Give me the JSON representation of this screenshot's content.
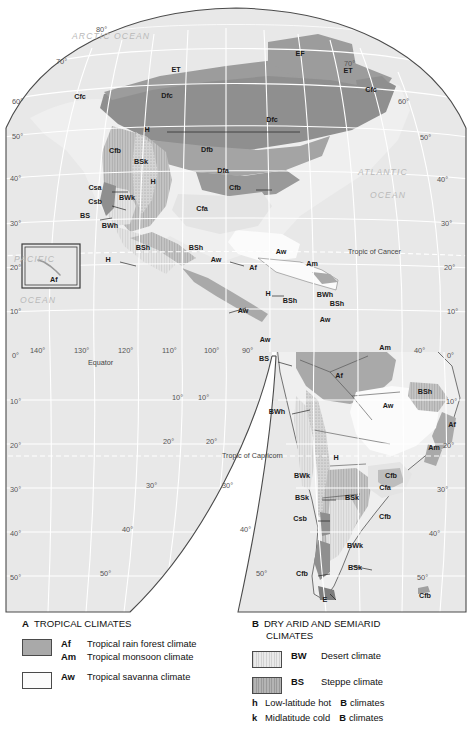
{
  "map": {
    "title": "Climate map of North and South America (Köppen classification)",
    "oceans": [
      {
        "name": "ARCTIC OCEAN",
        "x": 126,
        "y": 36
      },
      {
        "name": "ATLANTIC",
        "x": 388,
        "y": 172
      },
      {
        "name": "OCEAN",
        "x": 398,
        "y": 196
      },
      {
        "name": "PACIFIC",
        "x": 38,
        "y": 258
      },
      {
        "name": "OCEAN",
        "x": 44,
        "y": 300
      }
    ],
    "special_lines": [
      {
        "name": "Tropic of Cancer",
        "x": 370,
        "y": 257
      },
      {
        "name": "Equator",
        "x": 108,
        "y": 363
      },
      {
        "name": "Tropic of Capricorn",
        "x": 262,
        "y": 456
      }
    ],
    "lat_labels_left": [
      {
        "text": "60°",
        "x": 10,
        "y": 100
      },
      {
        "text": "50°",
        "x": 10,
        "y": 135
      },
      {
        "text": "40°",
        "x": 10,
        "y": 172
      },
      {
        "text": "30°",
        "x": 10,
        "y": 211
      },
      {
        "text": "20°",
        "x": 10,
        "y": 256
      },
      {
        "text": "10°",
        "x": 10,
        "y": 310
      },
      {
        "text": "0°",
        "x": 10,
        "y": 361
      },
      {
        "text": "10°",
        "x": 10,
        "y": 410
      },
      {
        "text": "20°",
        "x": 10,
        "y": 455
      },
      {
        "text": "30°",
        "x": 10,
        "y": 496
      },
      {
        "text": "40°",
        "x": 10,
        "y": 533
      },
      {
        "text": "50°",
        "x": 10,
        "y": 572
      }
    ],
    "lat_labels_right": [
      {
        "text": "60°",
        "x": 405,
        "y": 102
      },
      {
        "text": "50°",
        "x": 422,
        "y": 136
      },
      {
        "text": "40°",
        "x": 437,
        "y": 179
      },
      {
        "text": "30°",
        "x": 440,
        "y": 224
      },
      {
        "text": "20°",
        "x": 443,
        "y": 268
      },
      {
        "text": "10°",
        "x": 447,
        "y": 312
      },
      {
        "text": "0°",
        "x": 449,
        "y": 356
      },
      {
        "text": "10°",
        "x": 447,
        "y": 400
      },
      {
        "text": "20°",
        "x": 444,
        "y": 447
      },
      {
        "text": "30°",
        "x": 438,
        "y": 494
      },
      {
        "text": "40°",
        "x": 430,
        "y": 538
      },
      {
        "text": "50°",
        "x": 418,
        "y": 578
      }
    ],
    "lat_labels_interior": [
      {
        "text": "80°",
        "x": 107,
        "y": 30
      },
      {
        "text": "70°",
        "x": 63,
        "y": 62
      },
      {
        "text": "70°",
        "x": 352,
        "y": 63
      },
      {
        "text": "60°",
        "x": 22,
        "y": 102
      },
      {
        "text": "50°",
        "x": 20,
        "y": 137
      },
      {
        "text": "10°",
        "x": 178,
        "y": 396
      },
      {
        "text": "20°",
        "x": 170,
        "y": 440
      },
      {
        "text": "30°",
        "x": 152,
        "y": 484
      },
      {
        "text": "40°",
        "x": 128,
        "y": 528
      },
      {
        "text": "50°",
        "x": 108,
        "y": 572
      },
      {
        "text": "10°",
        "x": 205,
        "y": 396
      },
      {
        "text": "20°",
        "x": 213,
        "y": 440
      },
      {
        "text": "30°",
        "x": 228,
        "y": 484
      },
      {
        "text": "40°",
        "x": 246,
        "y": 528
      },
      {
        "text": "50°",
        "x": 261,
        "y": 572
      }
    ],
    "lon_labels": [
      {
        "text": "140°",
        "x": 33,
        "y": 353
      },
      {
        "text": "130°",
        "x": 78,
        "y": 353
      },
      {
        "text": "120°",
        "x": 122,
        "y": 353
      },
      {
        "text": "110°",
        "x": 165,
        "y": 353
      },
      {
        "text": "100°",
        "x": 207,
        "y": 353
      },
      {
        "text": "90°",
        "x": 243,
        "y": 353
      },
      {
        "text": "40°",
        "x": 418,
        "y": 353
      }
    ],
    "inset": {
      "label": "Af",
      "x": 22,
      "y": 244,
      "w": 58,
      "h": 44
    },
    "climate_labels": [
      {
        "code": "ET",
        "x": 176,
        "y": 72
      },
      {
        "code": "EF",
        "x": 300,
        "y": 56
      },
      {
        "code": "ET",
        "x": 348,
        "y": 73
      },
      {
        "code": "Cfc",
        "x": 371,
        "y": 92
      },
      {
        "code": "Cfc",
        "x": 80,
        "y": 99
      },
      {
        "code": "Dfc",
        "x": 167,
        "y": 98
      },
      {
        "code": "Dfc",
        "x": 272,
        "y": 122
      },
      {
        "code": "H",
        "x": 147,
        "y": 132
      },
      {
        "code": "Cfb",
        "x": 115,
        "y": 153
      },
      {
        "code": "Dfb",
        "x": 207,
        "y": 152
      },
      {
        "code": "BSk",
        "x": 141,
        "y": 164
      },
      {
        "code": "Dfa",
        "x": 223,
        "y": 173
      },
      {
        "code": "H",
        "x": 153,
        "y": 184
      },
      {
        "code": "Csa",
        "x": 95,
        "y": 190
      },
      {
        "code": "Cfb",
        "x": 235,
        "y": 190
      },
      {
        "code": "Csb",
        "x": 95,
        "y": 204
      },
      {
        "code": "BWk",
        "x": 127,
        "y": 200
      },
      {
        "code": "Cfa",
        "x": 202,
        "y": 211
      },
      {
        "code": "BS",
        "x": 85,
        "y": 218
      },
      {
        "code": "BWh",
        "x": 110,
        "y": 228
      },
      {
        "code": "BSh",
        "x": 143,
        "y": 250
      },
      {
        "code": "BSh",
        "x": 196,
        "y": 250
      },
      {
        "code": "Aw",
        "x": 281,
        "y": 254
      },
      {
        "code": "H",
        "x": 108,
        "y": 262
      },
      {
        "code": "Aw",
        "x": 216,
        "y": 262
      },
      {
        "code": "Af",
        "x": 253,
        "y": 270
      },
      {
        "code": "Am",
        "x": 312,
        "y": 266
      },
      {
        "code": "H",
        "x": 268,
        "y": 296
      },
      {
        "code": "BSh",
        "x": 290,
        "y": 303
      },
      {
        "code": "BWh",
        "x": 325,
        "y": 297
      },
      {
        "code": "BSh",
        "x": 337,
        "y": 306
      },
      {
        "code": "Aw",
        "x": 243,
        "y": 313
      },
      {
        "code": "Aw",
        "x": 325,
        "y": 322
      },
      {
        "code": "Aw",
        "x": 265,
        "y": 342
      },
      {
        "code": "Am",
        "x": 385,
        "y": 350
      },
      {
        "code": "BS",
        "x": 264,
        "y": 361
      },
      {
        "code": "Af",
        "x": 339,
        "y": 378
      },
      {
        "code": "BSh",
        "x": 425,
        "y": 394
      },
      {
        "code": "Aw",
        "x": 388,
        "y": 408
      },
      {
        "code": "BWh",
        "x": 277,
        "y": 414
      },
      {
        "code": "Af",
        "x": 452,
        "y": 427
      },
      {
        "code": "Am",
        "x": 434,
        "y": 450
      },
      {
        "code": "H",
        "x": 336,
        "y": 460
      },
      {
        "code": "BWk",
        "x": 302,
        "y": 478
      },
      {
        "code": "Cfb",
        "x": 391,
        "y": 478
      },
      {
        "code": "BSk",
        "x": 302,
        "y": 500
      },
      {
        "code": "BSk",
        "x": 352,
        "y": 500
      },
      {
        "code": "Cfa",
        "x": 385,
        "y": 490
      },
      {
        "code": "Csb",
        "x": 300,
        "y": 521
      },
      {
        "code": "Cfb",
        "x": 385,
        "y": 519
      },
      {
        "code": "BWk",
        "x": 355,
        "y": 548
      },
      {
        "code": "BSk",
        "x": 355,
        "y": 570
      },
      {
        "code": "Cfb",
        "x": 302,
        "y": 576
      },
      {
        "code": "E",
        "x": 325,
        "y": 602
      },
      {
        "code": "Cfb",
        "x": 425,
        "y": 598
      }
    ]
  },
  "legend": {
    "groups": [
      {
        "letter": "A",
        "heading": "TROPICAL CLIMATES",
        "heading_line2": "",
        "entries": [
          {
            "swatch": "af",
            "lines": [
              {
                "code": "Af",
                "desc": "Tropical rain forest climate"
              },
              {
                "code": "Am",
                "desc": "Tropical monsoon climate"
              }
            ]
          },
          {
            "swatch": "aw",
            "lines": [
              {
                "code": "Aw",
                "desc": "Tropical savanna climate"
              }
            ]
          }
        ],
        "notes": []
      },
      {
        "letter": "B",
        "heading": "DRY ARID AND SEMIARID",
        "heading_line2": "CLIMATES",
        "entries": [
          {
            "swatch": "bw",
            "lines": [
              {
                "code": "BW",
                "desc": "Desert climate"
              }
            ]
          },
          {
            "swatch": "bs",
            "lines": [
              {
                "code": "BS",
                "desc": "Steppe climate"
              }
            ]
          }
        ],
        "notes": [
          {
            "key": "h",
            "text": "Low-latitude hot",
            "bold": "B",
            "tail": "climates"
          },
          {
            "key": "k",
            "text": "Midlatitude cold",
            "bold": "B",
            "tail": "climates"
          }
        ]
      }
    ]
  },
  "colors": {
    "ocean": "#e8e8e8",
    "land_light": "#efefef",
    "af_gray": "#a9a9a9",
    "aw_white": "#fbfbfb",
    "bw_light": "#e0e0e0",
    "bs_gray": "#c4c4c4",
    "d_dark": "#8f8f8f",
    "frame": "#4a4a4a",
    "grid": "#ffffff",
    "text": "#1a1a1a"
  }
}
